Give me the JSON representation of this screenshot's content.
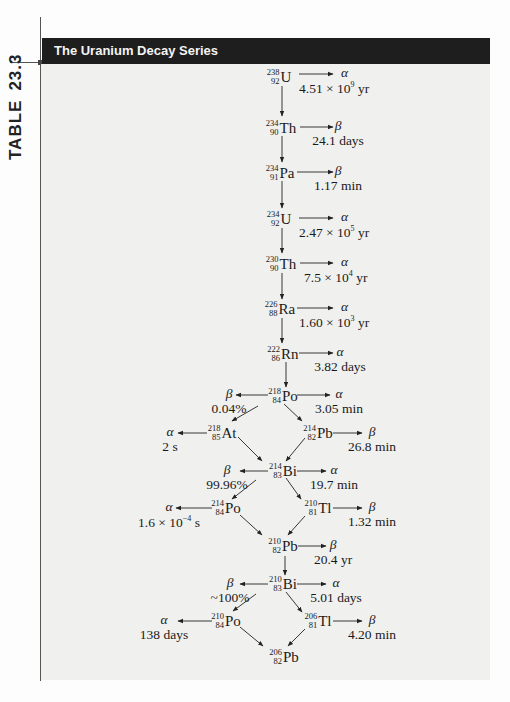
{
  "side_label": {
    "word": "TABLE",
    "number": "23.3"
  },
  "header": {
    "title": "The Uranium Decay Series"
  },
  "nuclides": {
    "u238": {
      "mass": "238",
      "z": "92",
      "symbol": "U"
    },
    "th234": {
      "mass": "234",
      "z": "90",
      "symbol": "Th"
    },
    "pa234": {
      "mass": "234",
      "z": "91",
      "symbol": "Pa"
    },
    "u234": {
      "mass": "234",
      "z": "92",
      "symbol": "U"
    },
    "th230": {
      "mass": "230",
      "z": "90",
      "symbol": "Th"
    },
    "ra226": {
      "mass": "226",
      "z": "88",
      "symbol": "Ra"
    },
    "rn222": {
      "mass": "222",
      "z": "86",
      "symbol": "Rn"
    },
    "po218": {
      "mass": "218",
      "z": "84",
      "symbol": "Po"
    },
    "at218": {
      "mass": "218",
      "z": "85",
      "symbol": "At"
    },
    "pb214": {
      "mass": "214",
      "z": "82",
      "symbol": "Pb"
    },
    "bi214": {
      "mass": "214",
      "z": "83",
      "symbol": "Bi"
    },
    "po214": {
      "mass": "214",
      "z": "84",
      "symbol": "Po"
    },
    "tl210": {
      "mass": "210",
      "z": "81",
      "symbol": "Tl"
    },
    "pb210": {
      "mass": "210",
      "z": "82",
      "symbol": "Pb"
    },
    "bi210": {
      "mass": "210",
      "z": "83",
      "symbol": "Bi"
    },
    "po210": {
      "mass": "210",
      "z": "84",
      "symbol": "Po"
    },
    "tl206": {
      "mass": "206",
      "z": "81",
      "symbol": "Tl"
    },
    "pb206": {
      "mass": "206",
      "z": "82",
      "symbol": "Pb"
    }
  },
  "decays": {
    "u238": {
      "particle": "α",
      "value": "4.51 × 10",
      "exp": "9",
      "unit": " yr"
    },
    "th234": {
      "particle": "β",
      "value": "24.1 days"
    },
    "pa234": {
      "particle": "β",
      "value": "1.17 min"
    },
    "u234": {
      "particle": "α",
      "value": "2.47 × 10",
      "exp": "5",
      "unit": " yr"
    },
    "th230": {
      "particle": "α",
      "value": "7.5 × 10",
      "exp": "4",
      "unit": " yr"
    },
    "ra226": {
      "particle": "α",
      "value": "1.60 × 10",
      "exp": "3",
      "unit": " yr"
    },
    "rn222": {
      "particle": "α",
      "value": "3.82 days"
    },
    "po218_right": {
      "particle": "α",
      "value": "3.05 min"
    },
    "po218_left": {
      "particle": "β",
      "value": "0.04%"
    },
    "at218": {
      "particle": "α",
      "value": "2 s"
    },
    "pb214": {
      "particle": "β",
      "value": "26.8 min"
    },
    "bi214_left": {
      "particle": "β",
      "value": "99.96%"
    },
    "bi214_right": {
      "particle": "α",
      "value": "19.7 min"
    },
    "po214": {
      "particle": "α",
      "value": "1.6 × 10",
      "exp": "−4",
      "unit": " s"
    },
    "tl210": {
      "particle": "β",
      "value": "1.32 min"
    },
    "pb210": {
      "particle": "β",
      "value": "20.4 yr"
    },
    "bi210_left": {
      "particle": "β",
      "value": "~100%"
    },
    "bi210_right": {
      "particle": "α",
      "value": "5.01 days"
    },
    "po210": {
      "particle": "α",
      "value": "138 days"
    },
    "tl206": {
      "particle": "β",
      "value": "4.20 min"
    }
  }
}
